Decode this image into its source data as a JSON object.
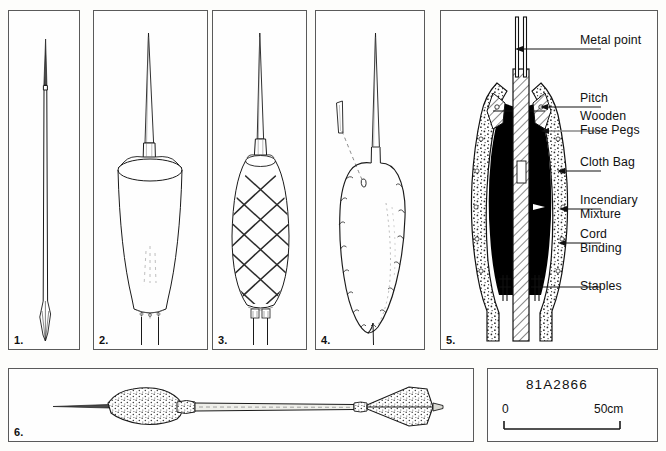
{
  "figure": {
    "catalog_number": "81A2866",
    "scale": {
      "start": "0",
      "end": "50cm"
    }
  },
  "panels": [
    {
      "number": "1.",
      "subject": "bare-metal-point-and-shaft"
    },
    {
      "number": "2.",
      "subject": "cloth-bag-over-shaft"
    },
    {
      "number": "3.",
      "subject": "cord-bound-bag"
    },
    {
      "number": "4.",
      "subject": "pitch-coated-head-with-fuse-peg"
    },
    {
      "number": "5.",
      "subject": "cutaway-cross-section"
    },
    {
      "number": "6.",
      "subject": "complete-fire-arrow"
    }
  ],
  "callouts": [
    {
      "id": "metal-point",
      "text": "Metal point"
    },
    {
      "id": "pitch",
      "text": "Pitch"
    },
    {
      "id": "wooden-fuse-pegs",
      "text": "Wooden\nFuse Pegs"
    },
    {
      "id": "cloth-bag",
      "text": "Cloth Bag"
    },
    {
      "id": "incendiary-mixture",
      "text": "Incendiary\nMixture"
    },
    {
      "id": "cord-binding",
      "text": "Cord\nBinding"
    },
    {
      "id": "staples",
      "text": "Staples"
    }
  ],
  "colors": {
    "frame": "#5a5a5a",
    "ink": "#111111",
    "leader_gray": "#8a8a8a",
    "background": "#fdfdfb"
  }
}
